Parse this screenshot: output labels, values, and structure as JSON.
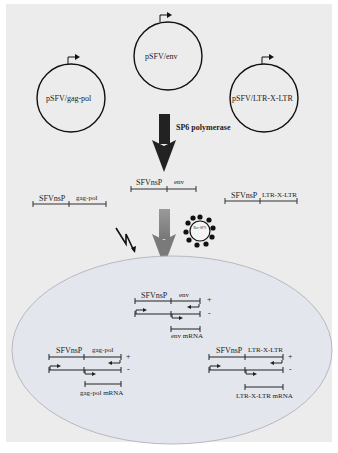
{
  "plasmids": [
    {
      "id": "env",
      "label": "pSFV/env"
    },
    {
      "id": "gag_pol",
      "label": "pSFV/gag-pol"
    },
    {
      "id": "ltr",
      "label": "pSFV/LTR-X-LTR"
    }
  ],
  "step_label": "SP6 polymerase",
  "transcripts": [
    {
      "id": "env",
      "left": "SFVnsP",
      "right": "env"
    },
    {
      "id": "gag_pol",
      "left": "SFVnsP",
      "right": "gag-pol"
    },
    {
      "id": "ltr",
      "left": "SFVnsP",
      "right": "LTR-X-LTR"
    }
  ],
  "virus_label": "Rec-SFV",
  "cell": {
    "constructs": [
      {
        "id": "env",
        "left": "SFVnsP",
        "right": "env",
        "plus": "+",
        "minus": "-",
        "mrna": "env mRNA"
      },
      {
        "id": "gag_pol",
        "left": "SFVnsP",
        "right": "gag-pol",
        "plus": "+",
        "minus": "-",
        "mrna": "gag-pol mRNA"
      },
      {
        "id": "ltr",
        "left": "SFVnsP",
        "right": "LTR-X-LTR",
        "plus": "+",
        "minus": "-",
        "mrna": "LTR-X-LTR mRNA"
      }
    ]
  },
  "colors": {
    "background": "#ececec",
    "cell_fill": "#e4e6ee",
    "cell_outline": "#b8b8c0",
    "dark_arrow": "#222222",
    "grey_arrow_top": "#9a9a9a",
    "grey_arrow_bottom": "#7a7a7a"
  }
}
